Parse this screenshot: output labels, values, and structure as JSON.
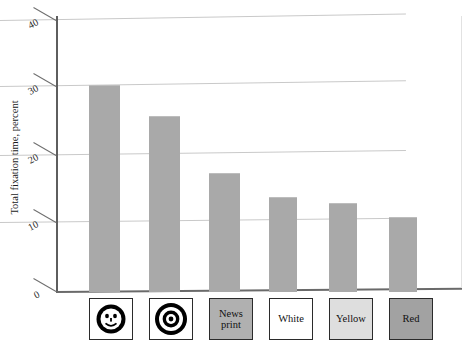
{
  "chart_data": {
    "type": "bar",
    "title": "",
    "xlabel": "",
    "ylabel": "Total fixation time, percent",
    "ylim": [
      0,
      40
    ],
    "yticks": [
      "0",
      "10",
      "20",
      "30",
      "40"
    ],
    "grid": true,
    "legend": "none",
    "categories": [
      "Smiley face",
      "Bullseye",
      "News print",
      "White",
      "Yellow",
      "Red"
    ],
    "category_labels": [
      "",
      "",
      "News\nprint",
      "White",
      "Yellow",
      "Red"
    ],
    "values": [
      30.5,
      26.0,
      17.5,
      14.0,
      13.0,
      11.0
    ],
    "bar_color": "#a9a9a9",
    "swatch_colors": [
      "#ffffff",
      "#ffffff",
      "#b0b0b0",
      "#ffffff",
      "#dedede",
      "#a2a2a2"
    ]
  },
  "axis": {
    "y_title": "Total fixation time, percent",
    "tick_0": "0",
    "tick_10": "10",
    "tick_20": "20",
    "tick_30": "30",
    "tick_40": "40"
  },
  "categories": {
    "c1_icon": "smiley-face",
    "c2_icon": "bullseye-target",
    "c3_line1": "News",
    "c3_line2": "print",
    "c4": "White",
    "c5": "Yellow",
    "c6": "Red"
  },
  "title": {
    "remnant": ""
  }
}
